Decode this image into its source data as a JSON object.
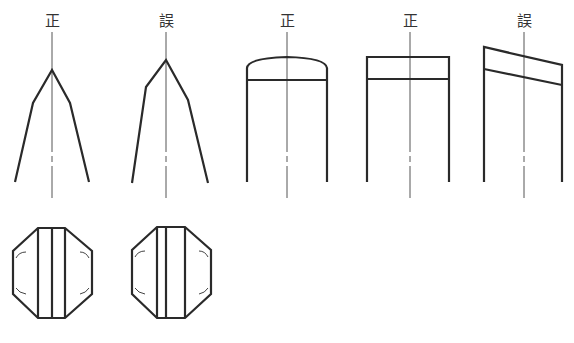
{
  "figures": {
    "fig1": {
      "label": "正",
      "meaning": "correct"
    },
    "fig2": {
      "label": "誤",
      "meaning": "wrong"
    },
    "fig3": {
      "label": "正",
      "meaning": "correct"
    },
    "fig4": {
      "label": "正",
      "meaning": "correct"
    },
    "fig5": {
      "label": "誤",
      "meaning": "wrong"
    }
  },
  "colors": {
    "line": "#2a2a2a",
    "axis": "#555555",
    "background": "#ffffff"
  }
}
